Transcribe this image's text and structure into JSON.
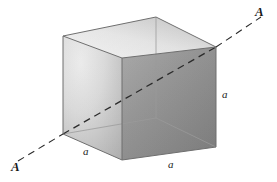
{
  "figure": {
    "kind": "geometric-diagram",
    "width": 277,
    "height": 182,
    "background_color": "#ffffff"
  },
  "labels": {
    "edge_length_left": "a",
    "edge_length_front": "a",
    "edge_length_vertical": "a",
    "axis_end_upper_right": "A",
    "axis_end_lower_left": "A"
  },
  "colors": {
    "background": "#ffffff",
    "top_face": "#e9e9e9",
    "top_face_shadow": "#c9c9c9",
    "left_face_light": "#e4e4e4",
    "left_face_dark": "#b4b4b4",
    "front_face_light": "#a3a3a3",
    "front_face_dark": "#848484",
    "edge_outline": "#6f6f6f",
    "interior_edge": "#9a9a9a",
    "dashed_axis": "#2b2b2b",
    "label_text": "#1a1a1a"
  },
  "geometry": {
    "projection": "oblique-axonometric",
    "vertices": {
      "top_back": [
        156,
        17
      ],
      "top_left": [
        63,
        36
      ],
      "top_front": [
        122,
        58
      ],
      "top_right": [
        216,
        47
      ],
      "bottom_left": [
        63,
        134
      ],
      "bottom_front": [
        122,
        160
      ],
      "bottom_right": [
        216,
        147
      ],
      "bottom_back_hidden": [
        156,
        118
      ]
    },
    "axis_line": {
      "start": [
        18,
        161
      ],
      "enters_cube_at": [
        63,
        134
      ],
      "exits_cube_at": [
        216,
        47
      ],
      "end": [
        261,
        17
      ],
      "style": "dashed",
      "dash_pattern": "7 5"
    }
  }
}
